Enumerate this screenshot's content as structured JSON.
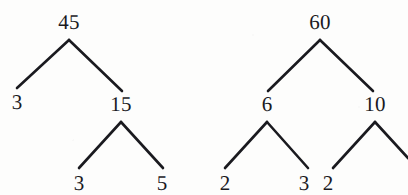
{
  "figure": {
    "kind": "factor-trees",
    "ink_color": "#1a1a1f",
    "background_color": "#fdfdfc",
    "width": 408,
    "height": 195
  },
  "trees": [
    {
      "name": "factor-tree-45",
      "root_value": "45",
      "nodes": [
        {
          "id": "l-root",
          "label": "45",
          "x": 69,
          "y": 22,
          "level": 0
        },
        {
          "id": "l-left",
          "label": "3",
          "x": 17,
          "y": 102,
          "level": 1
        },
        {
          "id": "l-right",
          "label": "15",
          "x": 121,
          "y": 104,
          "level": 1
        },
        {
          "id": "l-ll",
          "label": "3",
          "x": 79,
          "y": 183,
          "level": 2
        },
        {
          "id": "l-lr",
          "label": "5",
          "x": 162,
          "y": 183,
          "level": 2
        }
      ],
      "edges": [
        {
          "id": "l-e1",
          "from": "l-root",
          "to": "l-left",
          "x1": 69,
          "y1": 40,
          "x2": 17,
          "y2": 88
        },
        {
          "id": "l-e2",
          "from": "l-root",
          "to": "l-right",
          "x1": 69,
          "y1": 40,
          "x2": 122,
          "y2": 91
        },
        {
          "id": "l-e3",
          "from": "l-right",
          "to": "l-ll",
          "x1": 121,
          "y1": 122,
          "x2": 79,
          "y2": 168
        },
        {
          "id": "l-e4",
          "from": "l-right",
          "to": "l-lr",
          "x1": 121,
          "y1": 122,
          "x2": 163,
          "y2": 168
        }
      ]
    },
    {
      "name": "factor-tree-60",
      "root_value": "60",
      "nodes": [
        {
          "id": "r-root",
          "label": "60",
          "x": 320,
          "y": 22,
          "level": 0
        },
        {
          "id": "r-left",
          "label": "6",
          "x": 267,
          "y": 104,
          "level": 1
        },
        {
          "id": "r-right",
          "label": "10",
          "x": 375,
          "y": 104,
          "level": 1
        },
        {
          "id": "r-ll",
          "label": "2",
          "x": 225,
          "y": 183,
          "level": 2
        },
        {
          "id": "r-lr",
          "label": "3",
          "x": 304,
          "y": 183,
          "level": 2
        },
        {
          "id": "r-rl",
          "label": "2",
          "x": 328,
          "y": 183,
          "level": 2
        }
      ],
      "edges": [
        {
          "id": "r-e1",
          "from": "r-root",
          "to": "r-left",
          "x1": 320,
          "y1": 40,
          "x2": 268,
          "y2": 91
        },
        {
          "id": "r-e2",
          "from": "r-root",
          "to": "r-right",
          "x1": 320,
          "y1": 40,
          "x2": 373,
          "y2": 91
        },
        {
          "id": "r-e3",
          "from": "r-left",
          "to": "r-ll",
          "x1": 267,
          "y1": 122,
          "x2": 225,
          "y2": 168
        },
        {
          "id": "r-e4",
          "from": "r-left",
          "to": "r-lr",
          "x1": 267,
          "y1": 122,
          "x2": 308,
          "y2": 168
        },
        {
          "id": "r-e5",
          "from": "r-right",
          "to": "r-rl",
          "x1": 375,
          "y1": 122,
          "x2": 333,
          "y2": 168
        },
        {
          "id": "r-e6",
          "from": "r-right",
          "to": "cut-off",
          "x1": 375,
          "y1": 122,
          "x2": 408,
          "y2": 158
        }
      ]
    }
  ]
}
